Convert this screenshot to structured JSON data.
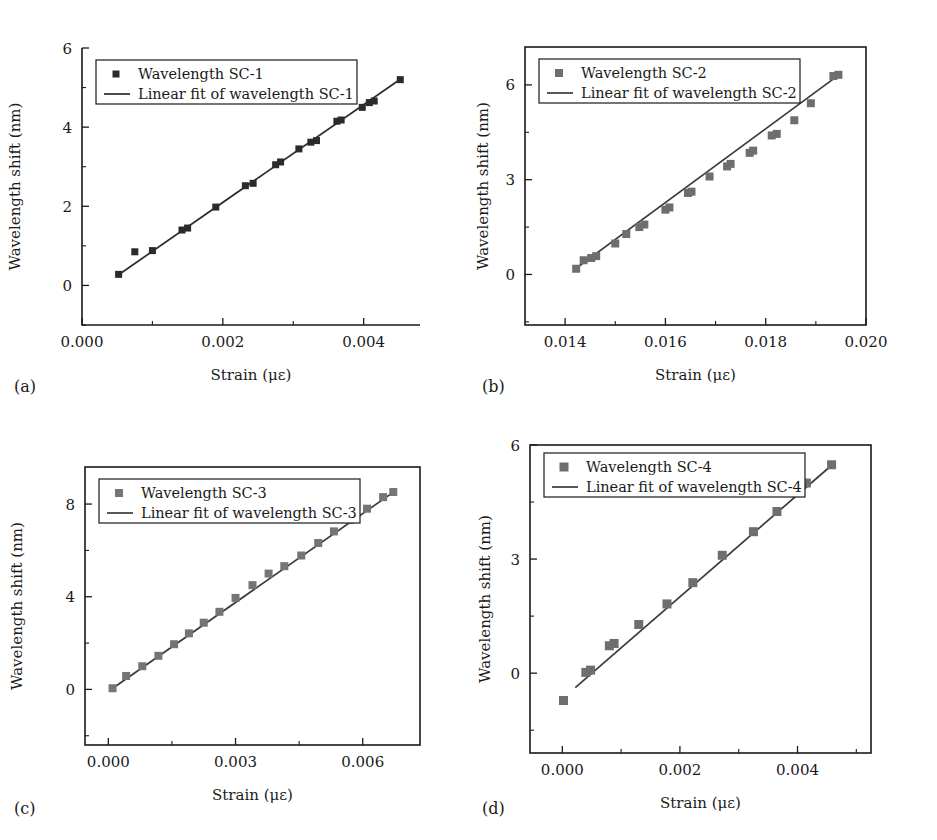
{
  "figure": {
    "background": "#ffffff",
    "panel_count": 4
  },
  "chart_data": [
    {
      "id": "a",
      "panel_letter": "(a)",
      "type": "scatter",
      "title": "",
      "xlabel": "Strain (με)",
      "ylabel": "Wavelength shift (nm)",
      "xlim": [
        0.0,
        0.0048
      ],
      "ylim": [
        -1.0,
        6.0
      ],
      "xticks": [
        0.0,
        0.002,
        0.004
      ],
      "xticklabels": [
        "0.000",
        "0.002",
        "0.004"
      ],
      "xminorticks": [
        0.001,
        0.003
      ],
      "yticks": [
        0,
        2,
        4,
        6
      ],
      "yticklabels": [
        "0",
        "2",
        "4",
        "6"
      ],
      "yminorticks": [
        -1,
        1,
        3,
        5
      ],
      "grid": false,
      "frame": "left-bottom",
      "marker_color": "#2b2b2b",
      "line_color": "#2b2b2b",
      "marker_size": 7,
      "legend_position": "upper-left",
      "legend": [
        {
          "label": "Wavelength SC-1",
          "kind": "marker"
        },
        {
          "label": "Linear fit of wavelength SC-1",
          "kind": "line"
        }
      ],
      "series": [
        {
          "name": "Wavelength SC-1",
          "x": [
            0.00052,
            0.00075,
            0.001,
            0.00142,
            0.0015,
            0.0019,
            0.00232,
            0.00243,
            0.00275,
            0.00282,
            0.00308,
            0.00325,
            0.00333,
            0.00362,
            0.00368,
            0.00398,
            0.00408,
            0.00415,
            0.00452
          ],
          "y": [
            0.28,
            0.85,
            0.88,
            1.4,
            1.45,
            1.98,
            2.52,
            2.58,
            3.05,
            3.12,
            3.45,
            3.62,
            3.66,
            4.15,
            4.18,
            4.5,
            4.62,
            4.66,
            5.2
          ]
        }
      ],
      "fit": {
        "name": "Linear fit of wavelength SC-1",
        "x": [
          0.00052,
          0.00452
        ],
        "y": [
          0.27,
          5.21
        ]
      }
    },
    {
      "id": "b",
      "panel_letter": "(b)",
      "type": "scatter",
      "title": "",
      "xlabel": "Strain (με)",
      "ylabel": "Wavelength shift (nm)",
      "xlim": [
        0.0132,
        0.02
      ],
      "ylim": [
        -1.6,
        7.2
      ],
      "xticks": [
        0.014,
        0.016,
        0.018,
        0.02
      ],
      "xticklabels": [
        "0.014",
        "0.016",
        "0.018",
        "0.020"
      ],
      "xminorticks": [
        0.015,
        0.017,
        0.019
      ],
      "yticks": [
        0,
        3,
        6
      ],
      "yticklabels": [
        "0",
        "3",
        "6"
      ],
      "yminorticks": [
        -1.5,
        1.5,
        4.5
      ],
      "grid": false,
      "frame": "box",
      "marker_color": "#6e6e6e",
      "line_color": "#3a3a3a",
      "marker_size": 8,
      "legend_position": "upper-left",
      "legend": [
        {
          "label": "Wavelength SC-2",
          "kind": "marker"
        },
        {
          "label": "Linear fit of wavelength SC-2",
          "kind": "line"
        }
      ],
      "series": [
        {
          "name": "Wavelength SC-2",
          "x": [
            0.01422,
            0.01437,
            0.01452,
            0.01462,
            0.015,
            0.01522,
            0.01548,
            0.01558,
            0.016,
            0.01608,
            0.01645,
            0.01652,
            0.01688,
            0.01723,
            0.0173,
            0.01768,
            0.01775,
            0.01812,
            0.01822,
            0.01857,
            0.0189,
            0.01935,
            0.01945
          ],
          "y": [
            0.18,
            0.45,
            0.52,
            0.58,
            0.98,
            1.28,
            1.5,
            1.58,
            2.05,
            2.12,
            2.58,
            2.62,
            3.1,
            3.42,
            3.5,
            3.85,
            3.92,
            4.4,
            4.45,
            4.88,
            5.42,
            6.28,
            6.32
          ]
        }
      ],
      "fit": {
        "name": "Linear fit of wavelength SC-2",
        "x": [
          0.01418,
          0.01948
        ],
        "y": [
          0.15,
          6.34
        ]
      }
    },
    {
      "id": "c",
      "panel_letter": "(c)",
      "type": "scatter",
      "title": "",
      "xlabel": "Strain (με)",
      "ylabel": "Wavelength shift (nm)",
      "xlim": [
        -0.00055,
        0.00735
      ],
      "ylim": [
        -2.4,
        9.6
      ],
      "xticks": [
        0.0,
        0.003,
        0.006
      ],
      "xticklabels": [
        "0.000",
        "0.003",
        "0.006"
      ],
      "xminorticks": [
        0.0015,
        0.0045
      ],
      "yticks": [
        0,
        4,
        8
      ],
      "yticklabels": [
        "0",
        "4",
        "8"
      ],
      "yminorticks": [
        -2,
        2,
        6
      ],
      "grid": false,
      "frame": "box",
      "marker_color": "#757575",
      "line_color": "#3a3a3a",
      "marker_size": 8,
      "legend_position": "upper-left",
      "legend": [
        {
          "label": "Wavelength SC-3",
          "kind": "marker"
        },
        {
          "label": "Linear fit of wavelength SC-3",
          "kind": "line"
        }
      ],
      "series": [
        {
          "name": "Wavelength SC-3",
          "x": [
            0.0001,
            0.00042,
            0.0008,
            0.00118,
            0.00155,
            0.0019,
            0.00225,
            0.00262,
            0.003,
            0.0034,
            0.00378,
            0.00415,
            0.00455,
            0.00495,
            0.00532,
            0.0057,
            0.0061,
            0.00648,
            0.00672
          ],
          "y": [
            0.05,
            0.58,
            1.0,
            1.45,
            1.95,
            2.42,
            2.88,
            3.35,
            3.95,
            4.5,
            5.0,
            5.32,
            5.78,
            6.32,
            6.82,
            7.32,
            7.8,
            8.3,
            8.52
          ]
        }
      ],
      "fit": {
        "name": "Linear fit of wavelength SC-3",
        "x": [
          8e-05,
          0.00675
        ],
        "y": [
          0.02,
          8.55
        ]
      }
    },
    {
      "id": "d",
      "panel_letter": "(d)",
      "type": "scatter",
      "title": "",
      "xlabel": "Strain (με)",
      "ylabel": "Wavelength shift (nm)",
      "xlim": [
        -0.00055,
        0.00525
      ],
      "ylim": [
        -2.1,
        6.0
      ],
      "xticks": [
        0.0,
        0.002,
        0.004
      ],
      "xticklabels": [
        "0.000",
        "0.002",
        "0.004"
      ],
      "xminorticks": [
        0.001,
        0.003,
        0.005
      ],
      "yticks": [
        0,
        3,
        6
      ],
      "yticklabels": [
        "0",
        "3",
        "6"
      ],
      "yminorticks": [
        -1.5,
        1.5,
        4.5
      ],
      "grid": false,
      "frame": "box",
      "marker_color": "#6e6e6e",
      "line_color": "#3a3a3a",
      "marker_size": 9,
      "legend_position": "upper-left",
      "legend": [
        {
          "label": "Wavelength SC-4",
          "kind": "marker"
        },
        {
          "label": "Linear fit of wavelength SC-4",
          "kind": "line"
        }
      ],
      "series": [
        {
          "name": "Wavelength SC-4",
          "x": [
            2e-05,
            0.0004,
            0.00048,
            0.0008,
            0.00088,
            0.0013,
            0.00178,
            0.00222,
            0.00272,
            0.00325,
            0.00365,
            0.00415,
            0.00458
          ],
          "y": [
            -0.72,
            0.02,
            0.08,
            0.72,
            0.78,
            1.28,
            1.82,
            2.38,
            3.1,
            3.72,
            4.25,
            5.0,
            5.48
          ]
        }
      ],
      "fit": {
        "name": "Linear fit of wavelength SC-4",
        "x": [
          0.00022,
          0.00462
        ],
        "y": [
          -0.38,
          5.52
        ]
      }
    }
  ]
}
